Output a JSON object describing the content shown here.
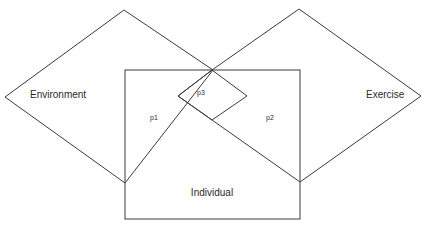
{
  "diagram": {
    "type": "overlap-diagram",
    "shapes": {
      "environment": {
        "label": "Environment",
        "shape": "diamond"
      },
      "exercise": {
        "label": "Exercise",
        "shape": "diamond"
      },
      "individual": {
        "label": "Individual",
        "shape": "rectangle"
      },
      "overlap": {
        "shape": "diamond"
      }
    },
    "regions": {
      "p1": "p1",
      "p2": "p2",
      "p3": "p3"
    },
    "colors": {
      "stroke": "#3a3a3a",
      "text": "#2a2a2a",
      "background": "#ffffff"
    }
  }
}
